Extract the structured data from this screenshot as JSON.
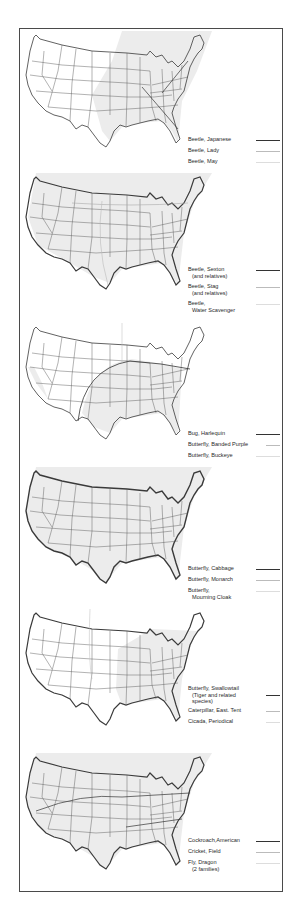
{
  "document": {
    "type": "range-map-plate",
    "map_subject": "United States (contiguous)",
    "panels": [
      {
        "id": "panel-1",
        "legend": [
          {
            "label": "Beetle, Japanese",
            "sub": "",
            "line_style": "dark"
          },
          {
            "label": "Beetle, Lady",
            "sub": "",
            "line_style": "mid"
          },
          {
            "label": "Beetle, May",
            "sub": "",
            "line_style": "light"
          }
        ]
      },
      {
        "id": "panel-2",
        "legend": [
          {
            "label": "Beetle, Sexton",
            "sub": "(and relatives)",
            "line_style": "dark"
          },
          {
            "label": "Beetle, Stag",
            "sub": "(and relatives)",
            "line_style": "mid"
          },
          {
            "label": "Beetle,",
            "sub": "Water Scavenger",
            "line_style": "light"
          }
        ]
      },
      {
        "id": "panel-3",
        "legend": [
          {
            "label": "Bug, Harlequin",
            "sub": "",
            "line_style": "dark"
          },
          {
            "label": "Butterfly, Banded Purple",
            "sub": "",
            "line_style": "mid"
          },
          {
            "label": "Butterfly, Buckeye",
            "sub": "",
            "line_style": "light"
          }
        ]
      },
      {
        "id": "panel-4",
        "legend": [
          {
            "label": "Butterfly, Cabbage",
            "sub": "",
            "line_style": "dark"
          },
          {
            "label": "Butterfly, Monarch",
            "sub": "",
            "line_style": "mid"
          },
          {
            "label": "Butterfly,",
            "sub": "Mourning Cloak",
            "line_style": "light"
          }
        ]
      },
      {
        "id": "panel-5",
        "legend": [
          {
            "label": "Butterfly, Swallowtail",
            "sub": "(Tiger and related species)",
            "line_style": "dark"
          },
          {
            "label": "Caterpillar, East. Tent",
            "sub": "",
            "line_style": "mid"
          },
          {
            "label": "Cicada, Periodical",
            "sub": "",
            "line_style": "light"
          }
        ]
      },
      {
        "id": "panel-6",
        "legend": [
          {
            "label": "Cockroach,American",
            "sub": "",
            "line_style": "dark"
          },
          {
            "label": "Cricket, Field",
            "sub": "",
            "line_style": "mid"
          },
          {
            "label": "Fly, Dragon",
            "sub": "(2 families)",
            "line_style": "light"
          }
        ]
      }
    ]
  },
  "colors": {
    "frame": "#4a4a4a",
    "map_outline": "#3a3a3a",
    "shade": "#e9e9e9",
    "text": "#2a2a2a"
  }
}
